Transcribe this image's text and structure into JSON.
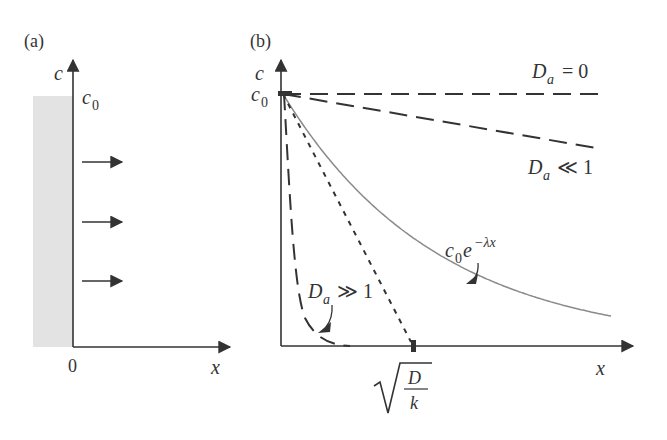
{
  "panel_a": {
    "label": "(a)",
    "y_axis_label": "c",
    "c0_label": "c",
    "c0_sub": "0",
    "origin_label": "0",
    "x_axis_label": "x",
    "flux_arrows": 3
  },
  "panel_b": {
    "label": "(b)",
    "y_axis_label": "c",
    "c0_label": "c",
    "c0_sub": "0",
    "x_axis_label": "x",
    "curves": [
      {
        "name": "Da = 0",
        "label_main": "D",
        "label_sub": "a",
        "label_rel": "= 0",
        "style": "long-dash"
      },
      {
        "name": "Da << 1",
        "label_main": "D",
        "label_sub": "a",
        "label_rel": "≪ 1",
        "style": "long-dash"
      },
      {
        "name": "c0 e^-lambda x",
        "label_main": "c",
        "label_sub": "0",
        "label_exp_base": "e",
        "label_exp": "−λx",
        "style": "solid-gray"
      },
      {
        "name": "Da >> 1",
        "label_main": "D",
        "label_sub": "a",
        "label_rel": "≫ 1",
        "style": "long-dash"
      },
      {
        "name": "tangent",
        "style": "short-dash"
      }
    ],
    "tick_label": {
      "numerator": "D",
      "denominator": "k",
      "radical": "√"
    }
  },
  "colors": {
    "ink": "#333333",
    "fill_gray": "#e3e3e3",
    "curve_gray": "#8a8a8a"
  }
}
